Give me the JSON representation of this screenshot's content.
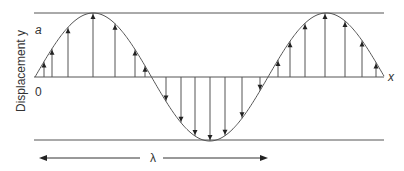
{
  "diagram": {
    "y_axis_label": "Displacement y",
    "x_axis_label": "x",
    "amplitude_label": "a",
    "origin_label": "0",
    "wavelength_label": "λ",
    "colors": {
      "line": "#555555",
      "text": "#333333",
      "background": "#ffffff"
    }
  }
}
